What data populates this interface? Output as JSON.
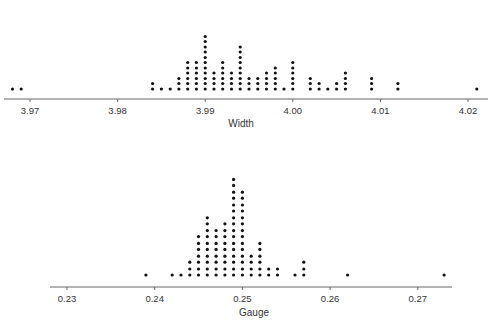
{
  "chart_data": [
    {
      "type": "scatter",
      "subtype": "dot_plot",
      "title": "",
      "xlabel": "Width",
      "ylabel": "",
      "xlim": [
        3.9665,
        4.0225
      ],
      "ticks": [
        3.97,
        3.98,
        3.99,
        4.0,
        4.01,
        4.02
      ],
      "tick_labels": [
        "3.97",
        "3.98",
        "3.99",
        "4.00",
        "4.01",
        "4.02"
      ],
      "grid": false,
      "points": [
        {
          "x": 3.968,
          "count": 1
        },
        {
          "x": 3.969,
          "count": 1
        },
        {
          "x": 3.984,
          "count": 2
        },
        {
          "x": 3.985,
          "count": 1
        },
        {
          "x": 3.986,
          "count": 1
        },
        {
          "x": 3.987,
          "count": 3
        },
        {
          "x": 3.988,
          "count": 6
        },
        {
          "x": 3.989,
          "count": 6
        },
        {
          "x": 3.99,
          "count": 11
        },
        {
          "x": 3.991,
          "count": 4
        },
        {
          "x": 3.992,
          "count": 6
        },
        {
          "x": 3.993,
          "count": 4
        },
        {
          "x": 3.994,
          "count": 9
        },
        {
          "x": 3.995,
          "count": 3
        },
        {
          "x": 3.996,
          "count": 3
        },
        {
          "x": 3.997,
          "count": 4
        },
        {
          "x": 3.998,
          "count": 5
        },
        {
          "x": 3.999,
          "count": 1
        },
        {
          "x": 4.0,
          "count": 6
        },
        {
          "x": 4.002,
          "count": 3
        },
        {
          "x": 4.003,
          "count": 2
        },
        {
          "x": 4.004,
          "count": 1
        },
        {
          "x": 4.005,
          "count": 2
        },
        {
          "x": 4.006,
          "count": 4
        },
        {
          "x": 4.009,
          "count": 3
        },
        {
          "x": 4.012,
          "count": 2
        },
        {
          "x": 4.021,
          "count": 1
        }
      ]
    },
    {
      "type": "scatter",
      "subtype": "dot_plot",
      "title": "",
      "xlabel": "Gauge",
      "ylabel": "",
      "xlim": [
        0.2281,
        0.2739
      ],
      "ticks": [
        0.23,
        0.24,
        0.25,
        0.26,
        0.27
      ],
      "tick_labels": [
        "0.23",
        "0.24",
        "0.25",
        "0.26",
        "0.27"
      ],
      "grid": false,
      "points": [
        {
          "x": 0.239,
          "count": 1
        },
        {
          "x": 0.242,
          "count": 1
        },
        {
          "x": 0.243,
          "count": 1
        },
        {
          "x": 0.244,
          "count": 3
        },
        {
          "x": 0.245,
          "count": 7
        },
        {
          "x": 0.246,
          "count": 10
        },
        {
          "x": 0.247,
          "count": 8
        },
        {
          "x": 0.248,
          "count": 9
        },
        {
          "x": 0.249,
          "count": 16
        },
        {
          "x": 0.25,
          "count": 14
        },
        {
          "x": 0.251,
          "count": 4
        },
        {
          "x": 0.252,
          "count": 6
        },
        {
          "x": 0.253,
          "count": 2
        },
        {
          "x": 0.254,
          "count": 2
        },
        {
          "x": 0.256,
          "count": 1
        },
        {
          "x": 0.257,
          "count": 3
        },
        {
          "x": 0.262,
          "count": 1
        },
        {
          "x": 0.273,
          "count": 1
        }
      ]
    }
  ],
  "plots": {
    "top": {
      "xlabel": "Width",
      "ticks": [
        "3.97",
        "3.98",
        "3.99",
        "4.00",
        "4.01",
        "4.02"
      ]
    },
    "bottom": {
      "xlabel": "Gauge",
      "ticks": [
        "0.23",
        "0.24",
        "0.25",
        "0.26",
        "0.27"
      ]
    }
  },
  "colors": {
    "dot": "#111111",
    "axis": "#666666",
    "text": "#333333"
  }
}
